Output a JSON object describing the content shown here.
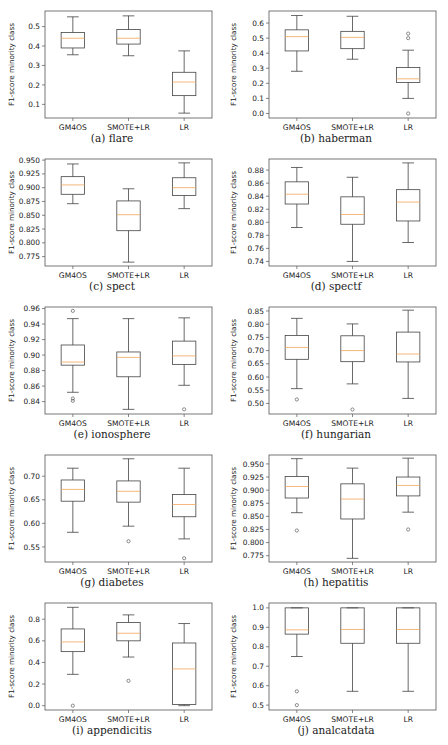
{
  "figure": {
    "layout": {
      "columns": 2,
      "rows": 5,
      "panel_width": 224,
      "panel_height": 148,
      "row_tops": [
        0,
        148,
        296,
        444,
        592
      ]
    },
    "colors": {
      "box": "#444444",
      "median": "#f2a65a",
      "frame": "#555555",
      "text": "#222222"
    }
  },
  "chart_data": [
    {
      "type": "box",
      "panel": "a",
      "caption": "(a) flare",
      "xlabel": "",
      "ylabel": "F1-score minority class",
      "categories": [
        "GM4OS",
        "SMOTE+LR",
        "LR"
      ],
      "ylim": [
        0.03,
        0.58
      ],
      "yticks": [
        0.1,
        0.2,
        0.3,
        0.4,
        0.5
      ],
      "ytick_labels": [
        "0.1",
        "0.2",
        "0.3",
        "0.4",
        "0.5"
      ],
      "boxes": [
        {
          "name": "GM4OS",
          "whislo": 0.355,
          "q1": 0.39,
          "med": 0.44,
          "q3": 0.47,
          "whishi": 0.55,
          "fliers": []
        },
        {
          "name": "SMOTE+LR",
          "whislo": 0.35,
          "q1": 0.41,
          "med": 0.44,
          "q3": 0.485,
          "whishi": 0.555,
          "fliers": []
        },
        {
          "name": "LR",
          "whislo": 0.055,
          "q1": 0.145,
          "med": 0.215,
          "q3": 0.265,
          "whishi": 0.375,
          "fliers": []
        }
      ]
    },
    {
      "type": "box",
      "panel": "b",
      "caption": "(b) haberman",
      "xlabel": "",
      "ylabel": "F1-score minority class",
      "categories": [
        "GM4OS",
        "SMOTE+LR",
        "LR"
      ],
      "ylim": [
        -0.03,
        0.68
      ],
      "yticks": [
        0.0,
        0.1,
        0.2,
        0.3,
        0.4,
        0.5,
        0.6
      ],
      "ytick_labels": [
        "0.0",
        "0.1",
        "0.2",
        "0.3",
        "0.4",
        "0.5",
        "0.6"
      ],
      "boxes": [
        {
          "name": "GM4OS",
          "whislo": 0.28,
          "q1": 0.415,
          "med": 0.51,
          "q3": 0.555,
          "whishi": 0.65,
          "fliers": []
        },
        {
          "name": "SMOTE+LR",
          "whislo": 0.36,
          "q1": 0.43,
          "med": 0.505,
          "q3": 0.545,
          "whishi": 0.645,
          "fliers": []
        },
        {
          "name": "LR",
          "whislo": 0.1,
          "q1": 0.205,
          "med": 0.23,
          "q3": 0.305,
          "whishi": 0.42,
          "fliers": [
            0.0,
            0.5,
            0.53
          ]
        }
      ]
    },
    {
      "type": "box",
      "panel": "c",
      "caption": "(c) spect",
      "xlabel": "",
      "ylabel": "F1-score minority class",
      "categories": [
        "GM4OS",
        "SMOTE+LR",
        "LR"
      ],
      "ylim": [
        0.758,
        0.952
      ],
      "yticks": [
        0.775,
        0.8,
        0.825,
        0.85,
        0.875,
        0.9,
        0.925,
        0.95
      ],
      "ytick_labels": [
        "0.775",
        "0.800",
        "0.825",
        "0.850",
        "0.875",
        "0.900",
        "0.925",
        "0.950"
      ],
      "boxes": [
        {
          "name": "GM4OS",
          "whislo": 0.871,
          "q1": 0.888,
          "med": 0.905,
          "q3": 0.92,
          "whishi": 0.943,
          "fliers": []
        },
        {
          "name": "SMOTE+LR",
          "whislo": 0.765,
          "q1": 0.822,
          "med": 0.851,
          "q3": 0.876,
          "whishi": 0.898,
          "fliers": []
        },
        {
          "name": "LR",
          "whislo": 0.862,
          "q1": 0.886,
          "med": 0.9,
          "q3": 0.918,
          "whishi": 0.945,
          "fliers": []
        }
      ]
    },
    {
      "type": "box",
      "panel": "d",
      "caption": "(d) spectf",
      "xlabel": "",
      "ylabel": "F1-score minority class",
      "categories": [
        "GM4OS",
        "SMOTE+LR",
        "LR"
      ],
      "ylim": [
        0.733,
        0.897
      ],
      "yticks": [
        0.74,
        0.76,
        0.78,
        0.8,
        0.82,
        0.84,
        0.86,
        0.88
      ],
      "ytick_labels": [
        "0.74",
        "0.76",
        "0.78",
        "0.80",
        "0.82",
        "0.84",
        "0.86",
        "0.88"
      ],
      "boxes": [
        {
          "name": "GM4OS",
          "whislo": 0.792,
          "q1": 0.828,
          "med": 0.843,
          "q3": 0.862,
          "whishi": 0.884,
          "fliers": []
        },
        {
          "name": "SMOTE+LR",
          "whislo": 0.74,
          "q1": 0.797,
          "med": 0.812,
          "q3": 0.839,
          "whishi": 0.869,
          "fliers": []
        },
        {
          "name": "LR",
          "whislo": 0.769,
          "q1": 0.802,
          "med": 0.831,
          "q3": 0.85,
          "whishi": 0.891,
          "fliers": []
        }
      ]
    },
    {
      "type": "box",
      "panel": "e",
      "caption": "(e) ionosphere",
      "xlabel": "",
      "ylabel": "F1-score minority class",
      "categories": [
        "GM4OS",
        "SMOTE+LR",
        "LR"
      ],
      "ylim": [
        0.824,
        0.962
      ],
      "yticks": [
        0.84,
        0.86,
        0.88,
        0.9,
        0.92,
        0.94,
        0.96
      ],
      "ytick_labels": [
        "0.84",
        "0.86",
        "0.88",
        "0.90",
        "0.92",
        "0.94",
        "0.96"
      ],
      "boxes": [
        {
          "name": "GM4OS",
          "whislo": 0.852,
          "q1": 0.887,
          "med": 0.891,
          "q3": 0.913,
          "whishi": 0.947,
          "fliers": [
            0.841,
            0.844,
            0.957
          ]
        },
        {
          "name": "SMOTE+LR",
          "whislo": 0.83,
          "q1": 0.872,
          "med": 0.897,
          "q3": 0.904,
          "whishi": 0.947,
          "fliers": []
        },
        {
          "name": "LR",
          "whislo": 0.861,
          "q1": 0.888,
          "med": 0.899,
          "q3": 0.918,
          "whishi": 0.948,
          "fliers": [
            0.83
          ]
        }
      ]
    },
    {
      "type": "box",
      "panel": "f",
      "caption": "(f) hungarian",
      "xlabel": "",
      "ylabel": "F1-score minority class",
      "categories": [
        "GM4OS",
        "SMOTE+LR",
        "LR"
      ],
      "ylim": [
        0.46,
        0.865
      ],
      "yticks": [
        0.5,
        0.55,
        0.6,
        0.65,
        0.7,
        0.75,
        0.8,
        0.85
      ],
      "ytick_labels": [
        "0.50",
        "0.55",
        "0.60",
        "0.65",
        "0.70",
        "0.75",
        "0.80",
        "0.85"
      ],
      "boxes": [
        {
          "name": "GM4OS",
          "whislo": 0.556,
          "q1": 0.667,
          "med": 0.712,
          "q3": 0.757,
          "whishi": 0.822,
          "fliers": [
            0.515
          ]
        },
        {
          "name": "SMOTE+LR",
          "whislo": 0.574,
          "q1": 0.658,
          "med": 0.7,
          "q3": 0.756,
          "whishi": 0.801,
          "fliers": [
            0.477
          ]
        },
        {
          "name": "LR",
          "whislo": 0.519,
          "q1": 0.657,
          "med": 0.687,
          "q3": 0.77,
          "whishi": 0.853,
          "fliers": []
        }
      ]
    },
    {
      "type": "box",
      "panel": "g",
      "caption": "(g) diabetes",
      "xlabel": "",
      "ylabel": "F1-score minority class",
      "categories": [
        "GM4OS",
        "SMOTE+LR",
        "LR"
      ],
      "ylim": [
        0.518,
        0.745
      ],
      "yticks": [
        0.55,
        0.6,
        0.65,
        0.7
      ],
      "ytick_labels": [
        "0.55",
        "0.60",
        "0.65",
        "0.70"
      ],
      "boxes": [
        {
          "name": "GM4OS",
          "whislo": 0.581,
          "q1": 0.647,
          "med": 0.672,
          "q3": 0.692,
          "whishi": 0.717,
          "fliers": []
        },
        {
          "name": "SMOTE+LR",
          "whislo": 0.594,
          "q1": 0.645,
          "med": 0.668,
          "q3": 0.69,
          "whishi": 0.737,
          "fliers": [
            0.562
          ]
        },
        {
          "name": "LR",
          "whislo": 0.567,
          "q1": 0.614,
          "med": 0.64,
          "q3": 0.661,
          "whishi": 0.717,
          "fliers": [
            0.526
          ]
        }
      ]
    },
    {
      "type": "box",
      "panel": "h",
      "caption": "(h) hepatitis",
      "xlabel": "",
      "ylabel": "F1-score minority class",
      "categories": [
        "GM4OS",
        "SMOTE+LR",
        "LR"
      ],
      "ylim": [
        0.763,
        0.967
      ],
      "yticks": [
        0.775,
        0.8,
        0.825,
        0.85,
        0.875,
        0.9,
        0.925,
        0.95
      ],
      "ytick_labels": [
        "0.775",
        "0.800",
        "0.825",
        "0.850",
        "0.875",
        "0.900",
        "0.925",
        "0.950"
      ],
      "boxes": [
        {
          "name": "GM4OS",
          "whislo": 0.857,
          "q1": 0.885,
          "med": 0.907,
          "q3": 0.926,
          "whishi": 0.96,
          "fliers": [
            0.823
          ]
        },
        {
          "name": "SMOTE+LR",
          "whislo": 0.77,
          "q1": 0.845,
          "med": 0.883,
          "q3": 0.912,
          "whishi": 0.942,
          "fliers": []
        },
        {
          "name": "LR",
          "whislo": 0.858,
          "q1": 0.889,
          "med": 0.909,
          "q3": 0.925,
          "whishi": 0.961,
          "fliers": [
            0.825
          ]
        }
      ]
    },
    {
      "type": "box",
      "panel": "i",
      "caption": "(i) appendicitis",
      "xlabel": "",
      "ylabel": "F1-score minority class",
      "categories": [
        "GM4OS",
        "SMOTE+LR",
        "LR"
      ],
      "ylim": [
        -0.04,
        0.95
      ],
      "yticks": [
        0.0,
        0.2,
        0.4,
        0.6,
        0.8
      ],
      "ytick_labels": [
        "0.0",
        "0.2",
        "0.4",
        "0.6",
        "0.8"
      ],
      "boxes": [
        {
          "name": "GM4OS",
          "whislo": 0.29,
          "q1": 0.5,
          "med": 0.59,
          "q3": 0.71,
          "whishi": 0.91,
          "fliers": [
            0.0
          ]
        },
        {
          "name": "SMOTE+LR",
          "whislo": 0.45,
          "q1": 0.6,
          "med": 0.67,
          "q3": 0.77,
          "whishi": 0.84,
          "fliers": [
            0.23
          ]
        },
        {
          "name": "LR",
          "whislo": 0.0,
          "q1": 0.01,
          "med": 0.34,
          "q3": 0.58,
          "whishi": 0.76,
          "fliers": []
        }
      ]
    },
    {
      "type": "box",
      "panel": "j",
      "caption": "(j) analcatdata",
      "xlabel": "",
      "ylabel": "F1-score minority class",
      "categories": [
        "GM4OS",
        "SMOTE+LR",
        "LR"
      ],
      "ylim": [
        0.475,
        1.025
      ],
      "yticks": [
        0.5,
        0.6,
        0.7,
        0.8,
        0.9,
        1.0
      ],
      "ytick_labels": [
        "0.5",
        "0.6",
        "0.7",
        "0.8",
        "0.9",
        "1.0"
      ],
      "boxes": [
        {
          "name": "GM4OS",
          "whislo": 0.75,
          "q1": 0.865,
          "med": 0.887,
          "q3": 1.0,
          "whishi": 1.0,
          "fliers": [
            0.5,
            0.571
          ]
        },
        {
          "name": "SMOTE+LR",
          "whislo": 0.571,
          "q1": 0.818,
          "med": 0.889,
          "q3": 1.0,
          "whishi": 1.0,
          "fliers": []
        },
        {
          "name": "LR",
          "whislo": 0.571,
          "q1": 0.818,
          "med": 0.889,
          "q3": 1.0,
          "whishi": 1.0,
          "fliers": []
        }
      ]
    }
  ]
}
